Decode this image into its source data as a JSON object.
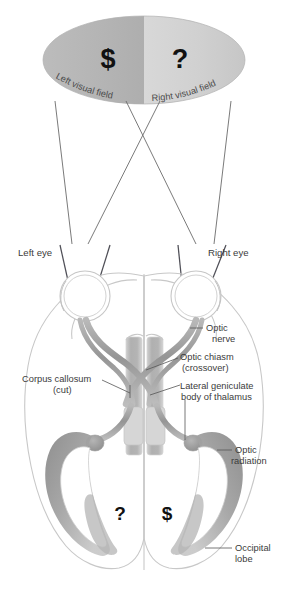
{
  "figure": {
    "type": "anatomical-diagram"
  },
  "visual_field": {
    "left_label": "Left visual field",
    "right_label": "Right visual field",
    "left_symbol": "$",
    "right_symbol": "?",
    "left_half_color": "#b6b6b6",
    "right_half_color": "#d2d2d2"
  },
  "eyes": {
    "left_label": "Left eye",
    "right_label": "Right eye"
  },
  "labels": {
    "optic_nerve": "Optic",
    "optic_nerve_2": "nerve",
    "optic_chiasm": "Optic chiasm",
    "optic_chiasm_2": "(crossover)",
    "corpus_callosum": "Corpus callosum",
    "corpus_callosum_2": "(cut)",
    "lateral_geniculate": "Lateral geniculate",
    "lateral_geniculate_2": "body of thalamus",
    "optic_radiation": "Optic",
    "optic_radiation_2": "radiation",
    "occipital_lobe": "Occipital",
    "occipital_lobe_2": "lobe"
  },
  "cortex_symbols": {
    "left_hemisphere_symbol": "?",
    "right_hemisphere_symbol": "$"
  },
  "colors": {
    "brain_outline": "#c8c8c8",
    "tract_gray": "#9a9a9a",
    "tract_light": "#cfcfcf",
    "radiation_fill": "#9d9d9d",
    "text": "#3b3b3b",
    "arrow": "#4f4f57"
  }
}
